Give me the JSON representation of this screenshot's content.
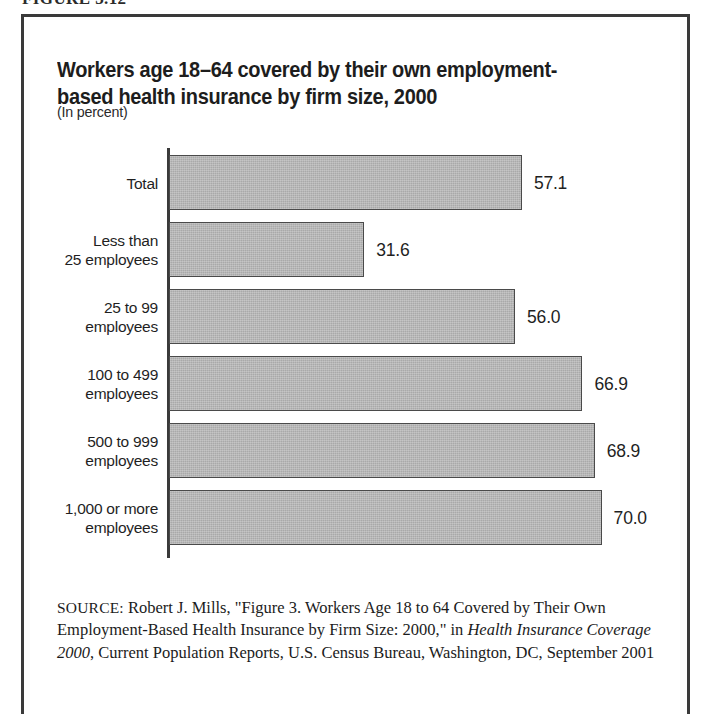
{
  "figure": {
    "label": "FIGURE 3.12"
  },
  "chart": {
    "title": "Workers age 18–64 covered by their own employment-based health insurance by firm size, 2000",
    "subtitle": "(In percent)"
  },
  "source": {
    "prefix": "SOURCE:",
    "text_before_italic": " Robert J. Mills, \"Figure 3. Workers Age 18 to 64 Covered by Their Own Employment-Based Health Insurance by Firm Size: 2000,\" in ",
    "italic_title": "Health Insurance Coverage 2000",
    "text_after_italic": ", Current Population Reports, U.S. Census Bureau, Washington, DC, September 2001"
  },
  "chart_data": {
    "type": "bar",
    "orientation": "horizontal",
    "title": "Workers age 18–64 covered by their own employment-based health insurance by firm size, 2000",
    "subtitle": "(In percent)",
    "xlabel": "",
    "ylabel": "",
    "unit": "percent",
    "xlim": [
      0,
      72
    ],
    "grid": false,
    "legend": false,
    "bar_color": "#a9a9a9",
    "bar_border_color": "#4a4a4a",
    "categories": [
      "Total",
      "Less than\n25 employees",
      "25 to 99\nemployees",
      "100 to 499\nemployees",
      "500 to 999\nemployees",
      "1,000 or more\nemployees"
    ],
    "values": [
      57.1,
      31.6,
      56.0,
      66.9,
      68.9,
      70.0
    ],
    "value_labels": [
      "57.1",
      "31.6",
      "56.0",
      "66.9",
      "68.9",
      "70.0"
    ]
  }
}
